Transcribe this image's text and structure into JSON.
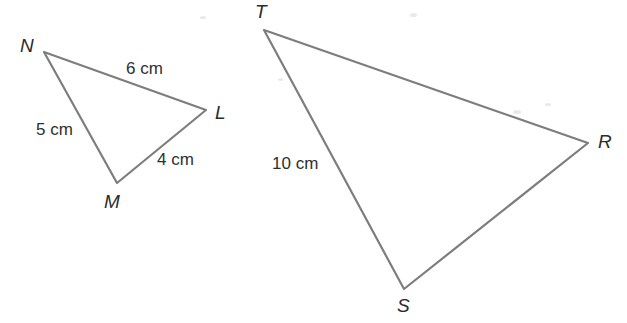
{
  "figure": {
    "background_color": "#ffffff",
    "stroke_color": "#7d7d7d",
    "stroke_width": 2.2,
    "label_color": "#2b2b2b",
    "measure_color": "#2f2f2f",
    "width": 627,
    "height": 323
  },
  "shapes": [
    {
      "name": "triangle-lmn",
      "type": "triangle",
      "vertices": [
        {
          "label": "N",
          "x": 44,
          "y": 52
        },
        {
          "label": "L",
          "x": 206,
          "y": 110
        },
        {
          "label": "M",
          "x": 117,
          "y": 183
        }
      ],
      "sides": [
        {
          "from": "N",
          "to": "L",
          "measure": "6 cm"
        },
        {
          "from": "L",
          "to": "M",
          "measure": "4 cm"
        },
        {
          "from": "M",
          "to": "N",
          "measure": "5 cm"
        }
      ]
    },
    {
      "name": "triangle-rst",
      "type": "triangle",
      "vertices": [
        {
          "label": "T",
          "x": 264,
          "y": 30
        },
        {
          "label": "R",
          "x": 588,
          "y": 143
        },
        {
          "label": "S",
          "x": 404,
          "y": 289
        }
      ],
      "sides": [
        {
          "from": "T",
          "to": "R",
          "measure": ""
        },
        {
          "from": "R",
          "to": "S",
          "measure": ""
        },
        {
          "from": "S",
          "to": "T",
          "measure": "10 cm"
        }
      ]
    }
  ],
  "vertex_labels": [
    {
      "name": "vertex-label-n",
      "text": "N",
      "x": 20,
      "y": 36
    },
    {
      "name": "vertex-label-l",
      "text": "L",
      "x": 215,
      "y": 103
    },
    {
      "name": "vertex-label-m",
      "text": "M",
      "x": 104,
      "y": 192
    },
    {
      "name": "vertex-label-t",
      "text": "T",
      "x": 255,
      "y": 2
    },
    {
      "name": "vertex-label-r",
      "text": "R",
      "x": 598,
      "y": 132
    },
    {
      "name": "vertex-label-s",
      "text": "S",
      "x": 397,
      "y": 296
    }
  ],
  "side_labels": [
    {
      "name": "side-label-nl",
      "text": "6 cm",
      "x": 126,
      "y": 60
    },
    {
      "name": "side-label-mn",
      "text": "5 cm",
      "x": 36,
      "y": 121
    },
    {
      "name": "side-label-lm",
      "text": "4 cm",
      "x": 157,
      "y": 151
    },
    {
      "name": "side-label-st",
      "text": "10 cm",
      "x": 272,
      "y": 155
    }
  ]
}
